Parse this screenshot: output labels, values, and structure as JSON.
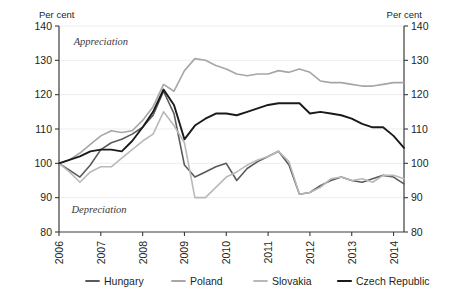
{
  "chart_data": {
    "type": "line",
    "title": "",
    "subtitle": "",
    "xlabel": "",
    "ylabel_left": "Per cent",
    "ylabel_right": "Per cent",
    "ylim": [
      80,
      140
    ],
    "yticks": [
      80,
      90,
      100,
      110,
      120,
      130,
      140
    ],
    "xlim": [
      2006,
      2014.25
    ],
    "xticks": [
      2006,
      2007,
      2008,
      2009,
      2010,
      2011,
      2012,
      2013,
      2014
    ],
    "xtick_labels": [
      "2006",
      "2007",
      "2008",
      "2009",
      "2010",
      "2011",
      "2012",
      "2013",
      "2014"
    ],
    "grid": true,
    "grid_axis": "y",
    "legend_position": "bottom",
    "frequency": "quarterly",
    "x": [
      2006.0,
      2006.25,
      2006.5,
      2006.75,
      2007.0,
      2007.25,
      2007.5,
      2007.75,
      2008.0,
      2008.25,
      2008.5,
      2008.75,
      2009.0,
      2009.25,
      2009.5,
      2009.75,
      2010.0,
      2010.25,
      2010.5,
      2010.75,
      2011.0,
      2011.25,
      2011.5,
      2011.75,
      2012.0,
      2012.25,
      2012.5,
      2012.75,
      2013.0,
      2013.25,
      2013.5,
      2013.75,
      2014.0,
      2014.25
    ],
    "series": [
      {
        "name": "Hungary",
        "color": "#5a5a5a",
        "width": 1.6,
        "values": [
          100.0,
          98.0,
          96.0,
          99.5,
          104.0,
          106.0,
          107.0,
          108.5,
          110.5,
          114.0,
          121.0,
          114.5,
          99.5,
          96.0,
          97.5,
          99.0,
          100.0,
          95.0,
          98.5,
          100.5,
          102.0,
          103.5,
          99.5,
          91.0,
          91.5,
          93.5,
          95.0,
          96.0,
          95.0,
          94.5,
          95.5,
          96.5,
          96.0,
          94.0
        ]
      },
      {
        "name": "Poland",
        "color": "#a6a6a6",
        "width": 1.6,
        "values": [
          100.0,
          101.0,
          103.0,
          105.5,
          108.0,
          109.5,
          109.0,
          109.5,
          112.5,
          116.5,
          123.0,
          121.0,
          127.0,
          130.5,
          130.0,
          128.5,
          127.5,
          126.0,
          125.5,
          126.0,
          126.0,
          127.0,
          126.5,
          127.5,
          126.5,
          124.0,
          123.5,
          123.5,
          123.0,
          122.5,
          122.5,
          123.0,
          123.5,
          123.5
        ]
      },
      {
        "name": "Slovakia",
        "color": "#b9b9b9",
        "width": 1.6,
        "values": [
          100.0,
          97.5,
          94.5,
          97.5,
          99.0,
          99.0,
          101.5,
          104.0,
          106.5,
          108.5,
          115.0,
          111.0,
          106.0,
          90.0,
          90.0,
          93.0,
          96.0,
          97.5,
          99.5,
          101.0,
          102.0,
          103.5,
          100.5,
          91.0,
          91.5,
          93.0,
          95.5,
          96.0,
          95.0,
          95.5,
          94.5,
          96.5,
          96.5,
          95.5
        ]
      },
      {
        "name": "Czech Republic",
        "color": "#1a1a1a",
        "width": 1.9,
        "values": [
          100.0,
          101.0,
          102.0,
          103.5,
          104.0,
          104.0,
          103.5,
          106.5,
          110.5,
          115.0,
          121.5,
          117.0,
          107.0,
          111.0,
          113.0,
          114.5,
          114.5,
          114.0,
          115.0,
          116.0,
          117.0,
          117.5,
          117.5,
          117.5,
          114.5,
          115.0,
          114.5,
          114.0,
          113.0,
          111.5,
          110.5,
          110.5,
          108.0,
          104.5
        ]
      }
    ],
    "annotations": [
      {
        "text": "Appreciation",
        "x": 2006.35,
        "y": 134.5,
        "id": "appreciation-note"
      },
      {
        "text": "Depreciation",
        "x": 2006.3,
        "y": 85.5,
        "id": "depreciation-note"
      }
    ],
    "legend": [
      {
        "label": "Hungary",
        "color": "#5a5a5a"
      },
      {
        "label": "Poland",
        "color": "#a6a6a6"
      },
      {
        "label": "Slovakia",
        "color": "#b9b9b9"
      },
      {
        "label": "Czech Republic",
        "color": "#1a1a1a"
      }
    ]
  }
}
